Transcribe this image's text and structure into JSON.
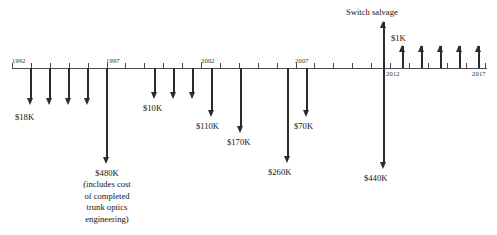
{
  "chart_data": {
    "type": "timeline",
    "title": "",
    "xlabel": "",
    "ylabel": "",
    "axis": {
      "y_position": 68,
      "x_start": 12,
      "x_end": 487,
      "tick_interval_years": 1,
      "tick_spacing_px": 18.9,
      "grid": false
    },
    "year_labels": [
      {
        "text": "1992",
        "x": 12,
        "position": "above"
      },
      {
        "text": "1997",
        "x": 106,
        "position": "above"
      },
      {
        "text": "2002",
        "x": 201,
        "position": "above"
      },
      {
        "text": "2007",
        "x": 295,
        "position": "above"
      },
      {
        "text": "2012",
        "x": 390,
        "position": "below"
      },
      {
        "text": "2017",
        "x": 484,
        "position": "below"
      }
    ],
    "annotations": [
      {
        "text": "Switch salvage",
        "x": 346,
        "y": 10
      }
    ],
    "cash_flows": [
      {
        "label": "$18K",
        "direction": "down",
        "x": 31,
        "length": 36,
        "label_x": 15,
        "label_y": 112
      },
      {
        "label": "",
        "direction": "down",
        "x": 50,
        "length": 36
      },
      {
        "label": "",
        "direction": "down",
        "x": 69,
        "length": 36
      },
      {
        "label": "",
        "direction": "down",
        "x": 88,
        "length": 36
      },
      {
        "label": "$480K\n(includes cost\nof completed\ntrunk optics\nengineering)",
        "direction": "down",
        "x": 107,
        "length": 95,
        "label_x": 67,
        "label_y": 168,
        "label_width": 80
      },
      {
        "label": "$10K",
        "direction": "down",
        "x": 155,
        "length": 30,
        "label_x": 143,
        "label_y": 103
      },
      {
        "label": "",
        "direction": "down",
        "x": 174,
        "length": 30
      },
      {
        "label": "",
        "direction": "down",
        "x": 193,
        "length": 30
      },
      {
        "label": "$110K",
        "direction": "down",
        "x": 212,
        "length": 48,
        "label_x": 196,
        "label_y": 121
      },
      {
        "label": "$170K",
        "direction": "down",
        "x": 241,
        "length": 64,
        "label_x": 227,
        "label_y": 137
      },
      {
        "label": "$260K",
        "direction": "down",
        "x": 288,
        "length": 94,
        "label_x": 268,
        "label_y": 167
      },
      {
        "label": "$70K",
        "direction": "down",
        "x": 307,
        "length": 48,
        "label_x": 294,
        "label_y": 121
      },
      {
        "label": "$440K",
        "direction": "down",
        "x": 384,
        "length": 100,
        "label_x": 364,
        "label_y": 173
      },
      {
        "label": "Switch salvage",
        "direction": "up",
        "x": 384,
        "length": 46
      },
      {
        "label": "$1K",
        "direction": "up",
        "x": 403,
        "length": 22,
        "label_x": 391,
        "label_y": 34
      },
      {
        "label": "",
        "direction": "up",
        "x": 422,
        "length": 22
      },
      {
        "label": "",
        "direction": "up",
        "x": 441,
        "length": 22
      },
      {
        "label": "",
        "direction": "up",
        "x": 460,
        "length": 22
      },
      {
        "label": "",
        "direction": "up",
        "x": 479,
        "length": 22
      }
    ],
    "money_labels": [
      "$18K",
      "$10K",
      "$110K",
      "$170K",
      "$260K",
      "$70K",
      "$440K",
      "$1K"
    ],
    "colors": {
      "axis": "#4a4a4a",
      "arrow": "#2b2b2b",
      "text": "#141414",
      "background": "#ffffff"
    }
  },
  "labels": {
    "year_1992": "1992",
    "year_1997": "1997",
    "year_2002": "2002",
    "year_2007": "2007",
    "year_2012": "2012",
    "year_2017": "2017",
    "amount_18k": "$18K",
    "amount_480k": "$480K\n(includes cost\nof completed\ntrunk optics\nengineering)",
    "amount_10k": "$10K",
    "amount_110k": "$110K",
    "amount_170k": "$170K",
    "amount_260k": "$260K",
    "amount_70k": "$70K",
    "amount_440k": "$440K",
    "amount_1k": "$1K",
    "switch_salvage": "Switch salvage"
  }
}
